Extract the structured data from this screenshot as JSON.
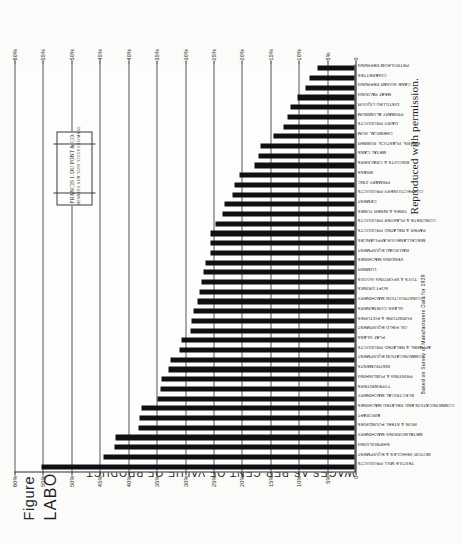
{
  "figure": {
    "number": "Figure 21-1",
    "title": "LABOR COSTS",
    "permission_note": "Reproduced with permission.",
    "source_note": "Based on Survey of Manufacturers Data for 1939"
  },
  "logo": {
    "brand": "FRANCIS I. DU PONT & CO.",
    "subtitle": "MEMBERS  NEW YORK STOCK EXCHANGE"
  },
  "chart_data": {
    "type": "bar",
    "title": "LABOR COSTS",
    "xlabel": "",
    "ylabel": "WAGES AS PER CENT OF VALUE OF PRODUCT",
    "ylim": [
      0,
      60
    ],
    "grid": true,
    "legend": "none",
    "ytick_labels": [
      "0",
      "5%",
      "10%",
      "15%",
      "20%",
      "25%",
      "30%",
      "35%",
      "40%",
      "45%",
      "50%",
      "55%",
      "60%"
    ],
    "ytick_values": [
      0,
      5,
      10,
      15,
      20,
      25,
      30,
      35,
      40,
      45,
      50,
      55,
      60
    ],
    "categories": [
      "TEXTILE MILL PRODUCTS",
      "MOTOR VEHICLES & EQUIPMENT",
      "SHIPBUILDING",
      "METALWORKING MACHINERY",
      "IRON & STEEL FOUNDRIES",
      "AIRCRAFT",
      "COMMUNICATION AND RELATED MACHINES",
      "ELECTRICAL MACHINERY",
      "TYPEWRITERS",
      "PRINTING & PUBLISHING",
      "INSTRUMENTS",
      "COMMUNICATION EQUIPMENT",
      "APPAREL & RELATED PRODUCTS",
      "FLAT GLASS",
      "OIL FIELD EQUIPMENT",
      "FURNITURE & FIXTURES",
      "GLASS CONTAINERS",
      "CONSTRUCTION MACHINERY",
      "SOFT DRINKS",
      "TOYS & SPORTING GOODS",
      "LUMBER",
      "VENDING MACHINES",
      "RAILROAD EQUIPMENT",
      "MISCELLANEOUS APPLIANCES",
      "PAPER & RELATED PRODUCTS",
      "CONCRETE & PLASTER PRODUCTS",
      "TIRES & INNER TUBES",
      "CEMENT",
      "CONFECTIONERY PRODUCTS",
      "PRIMARY ZINC",
      "BRASS",
      "BISCUITS & CRACKERS",
      "METAL CANS",
      "FIBERS, PLASTICS, RUBBER",
      "CHEMICAL GUM",
      "DAIRY PRODUCTS",
      "PRIMARY ALUMINUM",
      "DISTILLED LIQUOR",
      "MEAT PACKING",
      "CANE SUGAR REFINING",
      "CIGARETTES",
      "PETROLEUM REFINING"
    ],
    "values": [
      55.0,
      44.2,
      42.2,
      42.0,
      38.0,
      37.8,
      37.5,
      34.6,
      34.2,
      34.0,
      32.8,
      32.3,
      30.8,
      30.5,
      28.8,
      28.6,
      28.3,
      27.6,
      27.3,
      27.0,
      26.6,
      26.3,
      25.4,
      25.4,
      25.4,
      24.5,
      23.3,
      22.8,
      21.4,
      21.2,
      20.3,
      17.6,
      16.9,
      16.5,
      14.2,
      12.5,
      11.8,
      11.3,
      10.0,
      8.6,
      7.9,
      6.5
    ]
  }
}
